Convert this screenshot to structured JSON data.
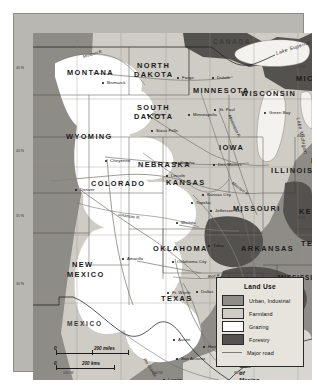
{
  "map": {
    "title": "Land Use — Central United States",
    "projection_note": "",
    "countries": [
      {
        "name": "CANADA",
        "x": 180,
        "y": 6
      },
      {
        "name": "MEXICO",
        "x": 34,
        "y": 288
      }
    ],
    "states": [
      {
        "name": "MONTANA",
        "x": 34,
        "y": 36,
        "size": "big"
      },
      {
        "name": "NORTH",
        "x": 104,
        "y": 29,
        "size": "big"
      },
      {
        "name": "DAKOTA",
        "x": 101,
        "y": 38,
        "size": "big"
      },
      {
        "name": "SOUTH",
        "x": 104,
        "y": 71,
        "size": "big"
      },
      {
        "name": "DAKOTA",
        "x": 101,
        "y": 80,
        "size": "big"
      },
      {
        "name": "MINNESOTA",
        "x": 160,
        "y": 54,
        "size": "big"
      },
      {
        "name": "WISCONSIN",
        "x": 208,
        "y": 57,
        "size": "big"
      },
      {
        "name": "MICHIGAN",
        "x": 263,
        "y": 42,
        "size": "big"
      },
      {
        "name": "WYOMING",
        "x": 33,
        "y": 100,
        "size": "big"
      },
      {
        "name": "NEBRASKA",
        "x": 105,
        "y": 128,
        "size": "big"
      },
      {
        "name": "IOWA",
        "x": 186,
        "y": 111,
        "size": "big"
      },
      {
        "name": "ILLINOIS",
        "x": 238,
        "y": 134,
        "size": "big"
      },
      {
        "name": "INDIANA",
        "x": 278,
        "y": 124,
        "size": "big"
      },
      {
        "name": "COLORADO",
        "x": 58,
        "y": 147,
        "size": "big"
      },
      {
        "name": "KANSAS",
        "x": 133,
        "y": 146,
        "size": "big"
      },
      {
        "name": "MISSOURI",
        "x": 200,
        "y": 172,
        "size": "big"
      },
      {
        "name": "KENTUCKY",
        "x": 266,
        "y": 175,
        "size": "big"
      },
      {
        "name": "OKLAHOMA",
        "x": 120,
        "y": 212,
        "size": "big"
      },
      {
        "name": "ARKANSAS",
        "x": 208,
        "y": 212,
        "size": "big"
      },
      {
        "name": "TENNESSEE",
        "x": 268,
        "y": 207,
        "size": "big"
      },
      {
        "name": "NEW",
        "x": 39,
        "y": 228,
        "size": "big"
      },
      {
        "name": "MEXICO",
        "x": 34,
        "y": 238,
        "size": "big"
      },
      {
        "name": "TEXAS",
        "x": 128,
        "y": 262,
        "size": "big"
      },
      {
        "name": "MISSISSIPPI",
        "x": 245,
        "y": 242,
        "size": "normal"
      },
      {
        "name": "LOUISIANA",
        "x": 209,
        "y": 264,
        "size": "normal"
      },
      {
        "name": "ALABAMA",
        "x": 285,
        "y": 246,
        "size": "normal"
      }
    ],
    "cities": [
      {
        "name": "Bismarck",
        "x": 72,
        "y": 48,
        "dx": 0,
        "dy": 0,
        "anchor": "right"
      },
      {
        "name": "Fargo",
        "x": 147,
        "y": 43,
        "anchor": "left"
      },
      {
        "name": "Duluth",
        "x": 182,
        "y": 43,
        "anchor": "left"
      },
      {
        "name": "Pierre",
        "x": 117,
        "y": 80,
        "anchor": "left"
      },
      {
        "name": "Sioux Falls",
        "x": 121,
        "y": 96,
        "anchor": "left"
      },
      {
        "name": "St. Paul",
        "x": 184,
        "y": 75,
        "anchor": "left"
      },
      {
        "name": "Minneapolis",
        "x": 158,
        "y": 80,
        "anchor": "left"
      },
      {
        "name": "Green Bay",
        "x": 234,
        "y": 78,
        "anchor": "left"
      },
      {
        "name": "Cheyenne",
        "x": 75,
        "y": 126,
        "anchor": "left"
      },
      {
        "name": "Omaha",
        "x": 145,
        "y": 128,
        "anchor": "left"
      },
      {
        "name": "Des Moines",
        "x": 183,
        "y": 130,
        "anchor": "left"
      },
      {
        "name": "Lincoln",
        "x": 136,
        "y": 141,
        "anchor": "left"
      },
      {
        "name": "Denver",
        "x": 45,
        "y": 155,
        "anchor": "left"
      },
      {
        "name": "Kansas City",
        "x": 172,
        "y": 160,
        "anchor": "left"
      },
      {
        "name": "Topeka",
        "x": 161,
        "y": 168,
        "anchor": "left"
      },
      {
        "name": "Jefferson City",
        "x": 180,
        "y": 176,
        "anchor": "left"
      },
      {
        "name": "Wichita",
        "x": 146,
        "y": 188,
        "anchor": "left"
      },
      {
        "name": "Tulsa",
        "x": 178,
        "y": 211,
        "anchor": "left"
      },
      {
        "name": "Oklahoma City",
        "x": 142,
        "y": 227,
        "anchor": "left"
      },
      {
        "name": "Amarillo",
        "x": 92,
        "y": 224,
        "anchor": "left"
      },
      {
        "name": "Ft. Worth",
        "x": 137,
        "y": 258,
        "anchor": "left"
      },
      {
        "name": "Dallas",
        "x": 166,
        "y": 257,
        "anchor": "left"
      },
      {
        "name": "Austin",
        "x": 143,
        "y": 305,
        "anchor": "left"
      },
      {
        "name": "Houston",
        "x": 173,
        "y": 312,
        "anchor": "left"
      },
      {
        "name": "Galveston",
        "x": 193,
        "y": 321,
        "anchor": "left"
      },
      {
        "name": "San Antonio",
        "x": 146,
        "y": 324,
        "anchor": "left"
      },
      {
        "name": "Laredo",
        "x": 133,
        "y": 345,
        "anchor": "left"
      }
    ],
    "water_labels": [
      {
        "name": "Lake Superior",
        "x": 243,
        "y": 18,
        "rot": -18
      },
      {
        "name": "Lake Michigan",
        "x": 265,
        "y": 82,
        "rot": 78
      }
    ],
    "rivers": [
      {
        "name": "Missouri R.",
        "x": 50,
        "y": 22,
        "rot": -16
      },
      {
        "name": "Mississippi R.",
        "x": 196,
        "y": 80,
        "rot": 66
      },
      {
        "name": "Missouri R.",
        "x": 199,
        "y": 148,
        "rot": 36
      },
      {
        "name": "Arkansas R.",
        "x": 85,
        "y": 180,
        "rot": 8
      },
      {
        "name": "Red R.",
        "x": 175,
        "y": 242,
        "rot": -6
      },
      {
        "name": "Rio Grande",
        "x": 111,
        "y": 324,
        "rot": 57
      }
    ],
    "gulf_label": {
      "lines": [
        "Gulf",
        "of",
        "Mexico"
      ],
      "x": 206,
      "y": 330
    },
    "grid_labels": [
      {
        "text": "45°N",
        "x": 16,
        "y": 67,
        "side": "left"
      },
      {
        "text": "40°N",
        "x": 16,
        "y": 150,
        "side": "left"
      },
      {
        "text": "35°N",
        "x": 16,
        "y": 215,
        "side": "left"
      },
      {
        "text": "30°N",
        "x": 16,
        "y": 283,
        "side": "left"
      },
      {
        "text": "45°N",
        "x": 297,
        "y": 66,
        "side": "right"
      },
      {
        "text": "40°N",
        "x": 297,
        "y": 135,
        "side": "right"
      },
      {
        "text": "35°N",
        "x": 297,
        "y": 217,
        "side": "right"
      },
      {
        "text": "105°W",
        "x": 63,
        "y": 372,
        "side": "bottom"
      },
      {
        "text": "100°W",
        "x": 152,
        "y": 372,
        "side": "bottom"
      },
      {
        "text": "95°W",
        "x": 234,
        "y": 372,
        "side": "bottom"
      }
    ],
    "scale": {
      "miles": {
        "zero": "0",
        "value": "200 miles"
      },
      "kms": {
        "zero": "0",
        "value": "200 kms"
      }
    },
    "legend": {
      "title": "Land Use",
      "items": [
        {
          "label": "Urban, Industrial",
          "swatch": "urban",
          "color": "#8e8c87"
        },
        {
          "label": "Farmland",
          "swatch": "farm",
          "color": "#cfccc5"
        },
        {
          "label": "Grazing",
          "swatch": "graz",
          "color": "#ffffff"
        },
        {
          "label": "Forestry",
          "swatch": "forest",
          "color": "#54524e"
        },
        {
          "label": "Major road",
          "swatch": "road",
          "color": "#7d7b76"
        }
      ]
    },
    "colors": {
      "urban": "#8e8c87",
      "farmland": "#cfccc5",
      "grazing": "#ffffff",
      "forestry": "#54524e",
      "road": "#7d7b76",
      "water": "#f2f1ee",
      "border": "#2a2a2a",
      "legend_bg": "#e7e4dd"
    }
  }
}
